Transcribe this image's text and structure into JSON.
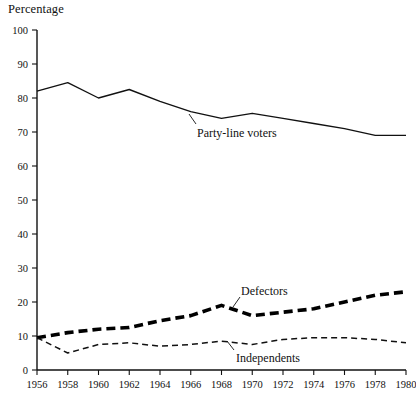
{
  "chart_data": {
    "type": "line",
    "title": "",
    "ylabel": "Percentage",
    "xlabel": "",
    "ylim": [
      0,
      100
    ],
    "ytick_step": 10,
    "yticks": [
      0,
      10,
      20,
      30,
      40,
      50,
      60,
      70,
      80,
      90,
      100
    ],
    "grid": false,
    "legend_position": "inline-annotations",
    "x": [
      1956,
      1958,
      1960,
      1962,
      1964,
      1966,
      1968,
      1970,
      1972,
      1974,
      1976,
      1978,
      1980
    ],
    "xticks": [
      "1956",
      "1958",
      "1960",
      "1962",
      "1964",
      "1966",
      "1968",
      "1970",
      "1972",
      "1974",
      "1976",
      "1978",
      "1980"
    ],
    "series": [
      {
        "name": "Party-line voters",
        "style": "solid",
        "values": [
          82,
          84.5,
          80,
          82.5,
          79,
          76,
          74,
          75.5,
          74,
          72.5,
          71,
          69,
          69
        ]
      },
      {
        "name": "Defectors",
        "style": "thick-dashed",
        "values": [
          9.5,
          11,
          12,
          12.5,
          14.5,
          16,
          19,
          16,
          17,
          18,
          20,
          22,
          23
        ]
      },
      {
        "name": "Independents",
        "style": "thin-dashed",
        "values": [
          9.5,
          5,
          7.5,
          8,
          7,
          7.5,
          8.5,
          7.5,
          9,
          9.5,
          9.5,
          9,
          8
        ]
      }
    ],
    "annotations": [
      {
        "text": "Party-line voters",
        "x": 1964,
        "y": 66
      },
      {
        "text": "Defectors",
        "x": 1968,
        "y": 24
      },
      {
        "text": "Independents",
        "x": 1968,
        "y": 4
      }
    ]
  },
  "axis": {
    "y_title": "Percentage"
  },
  "colors": {
    "ink": "#111111",
    "background": "#ffffff"
  }
}
